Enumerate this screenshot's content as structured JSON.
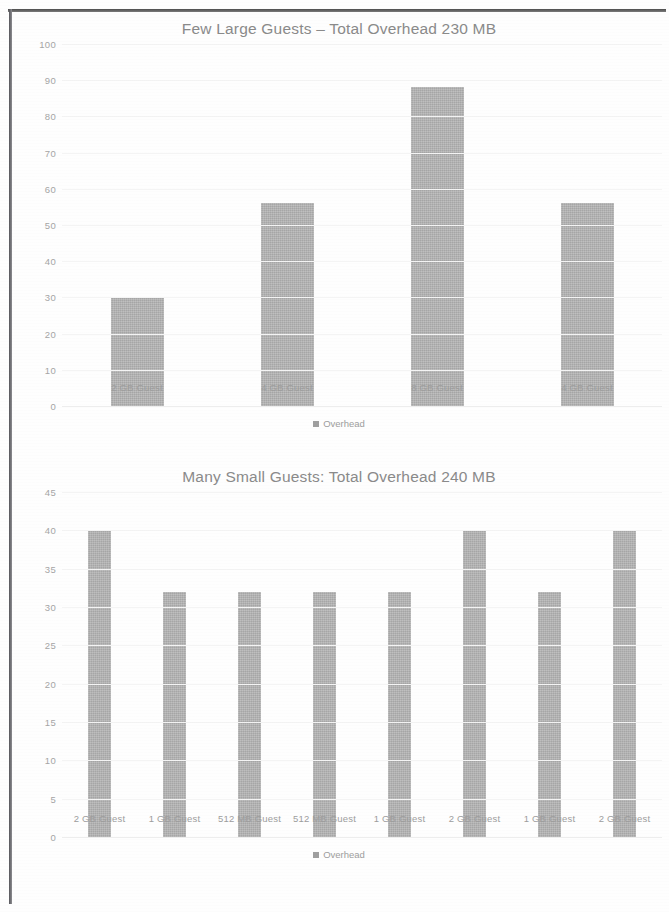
{
  "page": {
    "charts": [
      {
        "id": "few-large-guests",
        "title": "Few Large Guests – Total Overhead 230 MB",
        "legend_label": "Overhead"
      },
      {
        "id": "many-small-guests",
        "title": "Many Small Guests: Total Overhead 240 MB",
        "legend_label": "Overhead"
      }
    ]
  },
  "chart_data": [
    {
      "type": "bar",
      "title": "Few Large Guests – Total Overhead 230 MB",
      "categories": [
        "2 GB Guest",
        "4 GB Guest",
        "8 GB Guest",
        "4 GB Guest"
      ],
      "values": [
        30,
        56,
        88,
        56
      ],
      "series": [
        {
          "name": "Overhead",
          "values": [
            30,
            56,
            88,
            56
          ]
        }
      ],
      "xlabel": "",
      "ylabel": "",
      "ylim": [
        0,
        100
      ],
      "yticks": [
        100,
        90,
        80,
        70,
        60,
        50,
        40,
        30,
        20,
        10,
        0
      ],
      "grid": true,
      "legend": "Overhead",
      "legend_position": "bottom",
      "bar_color": "#aaaaaa"
    },
    {
      "type": "bar",
      "title": "Many Small Guests: Total Overhead 240 MB",
      "categories": [
        "2 GB Guest",
        "1 GB Guest",
        "512 MB Guest",
        "512 MB Guest",
        "1 GB Guest",
        "2 GB Guest",
        "1 GB Guest",
        "2 GB Guest"
      ],
      "values": [
        40,
        32,
        32,
        32,
        32,
        40,
        32,
        40
      ],
      "series": [
        {
          "name": "Overhead",
          "values": [
            40,
            32,
            32,
            32,
            32,
            40,
            32,
            40
          ]
        }
      ],
      "xlabel": "",
      "ylabel": "",
      "ylim": [
        0,
        45
      ],
      "yticks": [
        45,
        40,
        35,
        30,
        25,
        20,
        15,
        10,
        5,
        0
      ],
      "grid": true,
      "legend": "Overhead",
      "legend_position": "bottom",
      "bar_color": "#aaaaaa"
    }
  ]
}
